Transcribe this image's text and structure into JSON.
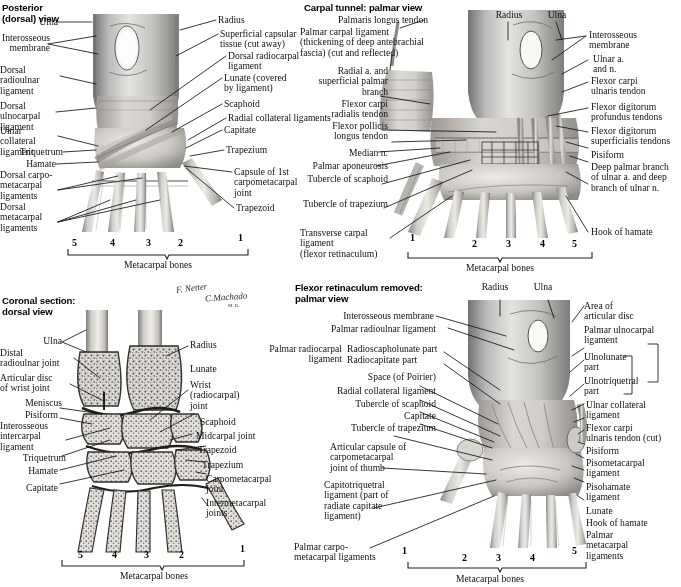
{
  "plate": {
    "title_note": "Netter anatomical plate — Wrist and hand: ligaments and carpal tunnel",
    "background": "#ffffff",
    "ink": "#111111"
  },
  "signatures": {
    "netter": "F. Netter",
    "machado": "C.Machado",
    "machado_sub": "M.D."
  },
  "metacarpal_caption": "Metacarpal bones",
  "panels": {
    "posterior_dorsal": {
      "title": "Posterior\n(dorsal) view",
      "numbers": [
        "5",
        "4",
        "3",
        "2",
        "1"
      ],
      "labels_left": [
        "Ulna",
        "Interosseous\nmembrane",
        "Dorsal radioulnar\nligament",
        "Dorsal ulnocarpal\nligament",
        "Ulnar collateral\nligament",
        "Triquetrum",
        "Hamate",
        "Dorsal carpo-\nmetacarpal\nligaments",
        "Dorsal\nmetacarpal\nligaments"
      ],
      "labels_right": [
        "Radius",
        "Superficial capsular\ntissue (cut away)",
        "Dorsal radiocarpal\nligament",
        "Lunate (covered\nby ligament)",
        "Scaphoid",
        "Radial collateral ligaments",
        "Capitate",
        "Trapezium",
        "Capsule of 1st\ncarpometacarpal\njoint",
        "Trapezoid"
      ]
    },
    "carpal_tunnel": {
      "title": "Carpal tunnel: palmar view",
      "numbers": [
        "1",
        "2",
        "3",
        "4",
        "5"
      ],
      "labels_left": [
        "Palmaris longus tendon",
        "Palmar carpal ligament\n(thickening of deep antebrachial\nfascia) (cut and reflected)",
        "Radial a. and\nsuperficial palmar\nbranch",
        "Flexor carpi\nradialis tendon",
        "Flexor pollicis\nlongus tendon",
        "Median n.",
        "Palmar aponeurosis",
        "Tubercle of scaphoid",
        "Tubercle of trapezium",
        "Transverse carpal ligament\n(flexor retinaculum)"
      ],
      "labels_top": [
        "Radius",
        "Ulna"
      ],
      "labels_right": [
        "Interosseous\nmembrane",
        "Ulnar a.\nand n.",
        "Flexor carpi\nulnaris tendon",
        "Flexor digitorum\nprofundus tendons",
        "Flexor digitorum\nsuperficialis tendons",
        "Pisiform",
        "Deep palmar branch\nof ulnar a. and deep\nbranch of ulnar n.",
        "Hook of hamate"
      ]
    },
    "coronal_section": {
      "title": "Coronal section:\ndorsal view",
      "numbers": [
        "5",
        "4",
        "3",
        "2",
        "1"
      ],
      "labels_left": [
        "Ulna",
        "Distal\nradioulnar joint",
        "Articular disc\nof wrist joint",
        "Meniscus",
        "Pisiform",
        "Interosseous\nintercarpal\nligament",
        "Triquetrum",
        "Hamate",
        "Capitate"
      ],
      "labels_right": [
        "Radius",
        "Lunate",
        "Wrist\n(radiocarpal)\njoint",
        "Scaphoid",
        "Midcarpal joint",
        "Trapezoid",
        "Trapezium",
        "Carpometacarpal\njoint",
        "Intermetacarpal\njoints"
      ]
    },
    "flexor_retinaculum_removed": {
      "title": "Flexor retinaculum removed:\npalmar view",
      "numbers": [
        "1",
        "2",
        "3",
        "4",
        "5"
      ],
      "labels_top": [
        "Radius",
        "Ulna"
      ],
      "labels_left": [
        "Interosseous membrane",
        "Palmar radioulnar ligament",
        "Palmar radiocarpal\nligament",
        "Radioscapholunate part",
        "Radiocapitate part",
        "Space (of Poirier)",
        "Radial collateral ligament",
        "Tubercle of scaphoid",
        "Capitate",
        "Tubercle of trapezium",
        "Articular capsule of\ncarpometacarpal\njoint of thumb",
        "Capitotriquetral\nligament (part of\nradiate capitate\nligament)",
        "Palmar carpo-\nmetacarpal ligaments"
      ],
      "labels_right": [
        "Area of\narticular disc",
        "Palmar ulnocarpal\nligament",
        "Ulnolunate\npart",
        "Ulnotriquetral\npart",
        "Ulnar collateral\nligament",
        "Flexor carpi\nulnaris tendon (cut)",
        "Pisiform",
        "Pisometacarpal\nligament",
        "Pisohamate\nligament",
        "Lunate",
        "Hook of hamate",
        "Palmar\nmetacarpal\nligaments"
      ]
    }
  }
}
